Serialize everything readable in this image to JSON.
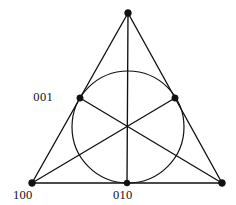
{
  "figure": {
    "background_color": "#ffffff",
    "stroke_color": "#111111",
    "width": 236,
    "height": 205
  },
  "geometry": {
    "triangle": {
      "vertices": [
        {
          "name": "apex",
          "x": 128,
          "y": 13
        },
        {
          "name": "bottom-left",
          "x": 32,
          "y": 183
        },
        {
          "name": "bottom-right",
          "x": 222,
          "y": 183
        }
      ],
      "edges": [
        {
          "name": "left-edge",
          "from": "apex",
          "to": "bottom-left"
        },
        {
          "name": "right-edge",
          "from": "apex",
          "to": "bottom-right"
        },
        {
          "name": "bottom-edge",
          "from": "bottom-left",
          "to": "bottom-right"
        }
      ]
    },
    "midpoints": [
      {
        "name": "left-edge-midpoint",
        "x": 80,
        "y": 98
      },
      {
        "name": "right-edge-midpoint",
        "x": 175,
        "y": 98
      },
      {
        "name": "bottom-edge-midpoint",
        "x": 127,
        "y": 183
      }
    ],
    "centroid": {
      "x": 128,
      "y": 127
    },
    "incircle": {
      "cx": 128,
      "cy": 127,
      "r": 56
    },
    "medians": [
      {
        "name": "median-apex-to-bottom",
        "x1": 128,
        "y1": 13,
        "x2": 127,
        "y2": 183
      },
      {
        "name": "median-bottomleft-to-rightedge",
        "x1": 32,
        "y1": 183,
        "x2": 175,
        "y2": 98
      },
      {
        "name": "median-bottomright-to-leftedge",
        "x1": 222,
        "y1": 183,
        "x2": 80,
        "y2": 98
      }
    ]
  },
  "labels": {
    "left_midpoint": {
      "text": "001",
      "x": 53,
      "y": 101
    },
    "bottom_left_vertex": {
      "text": "100",
      "x": 13,
      "y": 199
    },
    "bottom_midpoint": {
      "text": "010",
      "x": 113,
      "y": 199
    }
  },
  "dots": {
    "vertices": [
      {
        "name": "vertex-dot-apex",
        "cx": 128,
        "cy": 13,
        "r": 3.4
      },
      {
        "name": "vertex-dot-bottom-left",
        "cx": 32,
        "cy": 183,
        "r": 3.4
      },
      {
        "name": "vertex-dot-bottom-right",
        "cx": 222,
        "cy": 183,
        "r": 3.4
      }
    ],
    "tangents": [
      {
        "name": "tangent-dot-left",
        "cx": 80,
        "cy": 98,
        "r": 3.2
      },
      {
        "name": "tangent-dot-right",
        "cx": 175,
        "cy": 98,
        "r": 3.2
      },
      {
        "name": "tangent-dot-bottom",
        "cx": 127,
        "cy": 183,
        "r": 3.0
      }
    ]
  }
}
